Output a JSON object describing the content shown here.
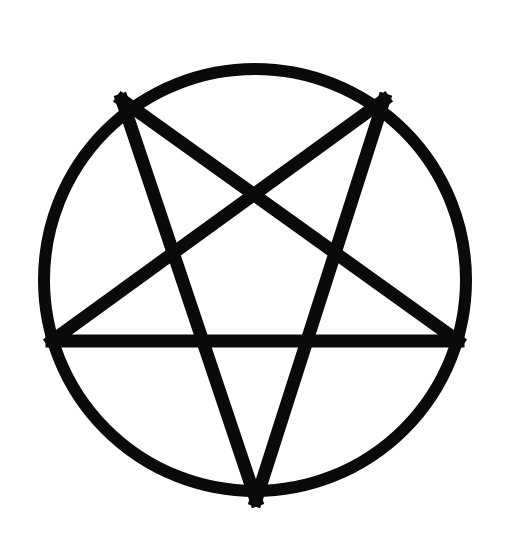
{
  "figure": {
    "description": "Inverted pentagram inscribed in a circle",
    "icon": "pentagram-in-circle-icon",
    "colors": {
      "background": "#ffffff",
      "stroke": "#0a0a0a"
    },
    "circle": {
      "cx": 255,
      "cy": 280,
      "r": 211,
      "stroke_width": 12
    },
    "points": [
      {
        "name": "top-left",
        "x": 122,
        "y": 100
      },
      {
        "name": "top-right",
        "x": 384,
        "y": 100
      },
      {
        "name": "middle-left",
        "x": 52,
        "y": 341
      },
      {
        "name": "middle-right",
        "x": 458,
        "y": 341
      },
      {
        "name": "bottom",
        "x": 256,
        "y": 500
      }
    ],
    "line_width": 13
  }
}
